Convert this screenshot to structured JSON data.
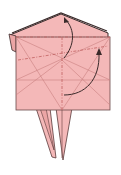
{
  "diagram": {
    "type": "origami-fold-step",
    "colors": {
      "paper": "#f4b8b8",
      "paper_shade": "#eba5a5",
      "edge": "#5a3a3a",
      "crease": "#c98080",
      "mountain_fold": "#c06060",
      "arrow": "#3a2a2a",
      "background": "#ffffff"
    },
    "elements": [
      {
        "name": "top-flap",
        "kind": "paper"
      },
      {
        "name": "square-body",
        "kind": "paper"
      },
      {
        "name": "left-leg",
        "kind": "paper"
      },
      {
        "name": "right-leg",
        "kind": "paper"
      },
      {
        "name": "fold-arrow-up",
        "kind": "arrow"
      },
      {
        "name": "fold-arrow-right",
        "kind": "arrow"
      }
    ]
  }
}
